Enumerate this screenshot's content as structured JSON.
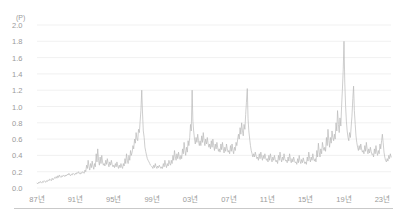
{
  "chart_data": {
    "type": "line",
    "title": "",
    "subtitle": "",
    "unit_label": "(P)",
    "xlabel": "",
    "ylabel": "",
    "ylim": [
      0.0,
      2.0
    ],
    "ytick_labels": [
      "2.0",
      "1.8",
      "1.6",
      "1.4",
      "1.2",
      "1.0",
      "0.8",
      "0.6",
      "0.4",
      "0.2",
      "0.0"
    ],
    "ytick_values": [
      2.0,
      1.8,
      1.6,
      1.4,
      1.2,
      1.0,
      0.8,
      0.6,
      0.4,
      0.2,
      0.0
    ],
    "xtick_labels": [
      "87년",
      "91년",
      "95년",
      "99년",
      "03년",
      "07년",
      "11년",
      "15년",
      "19년",
      "23년"
    ],
    "xtick_values": [
      1987,
      1991,
      1995,
      1999,
      2003,
      2007,
      2011,
      2015,
      2019,
      2023
    ],
    "xlim": [
      1987,
      2023.9
    ],
    "grid": true,
    "grid_axis": "y",
    "legend": false,
    "legend_position": "none",
    "line_color": "#b9b9b9",
    "grid_color": "#ebebeb",
    "text_color": "#9a9a9a",
    "series": [
      {
        "name": "series-1",
        "x": [
          1987.0,
          1987.08,
          1987.17,
          1987.25,
          1987.33,
          1987.42,
          1987.5,
          1987.58,
          1987.67,
          1987.75,
          1987.83,
          1987.92,
          1988.0,
          1988.08,
          1988.17,
          1988.25,
          1988.33,
          1988.42,
          1988.5,
          1988.58,
          1988.67,
          1988.75,
          1988.83,
          1988.92,
          1989.0,
          1989.08,
          1989.17,
          1989.25,
          1989.33,
          1989.42,
          1989.5,
          1989.58,
          1989.67,
          1989.75,
          1989.83,
          1989.92,
          1990.0,
          1990.08,
          1990.17,
          1990.25,
          1990.33,
          1990.42,
          1990.5,
          1990.58,
          1990.67,
          1990.75,
          1990.83,
          1990.92,
          1991.0,
          1991.08,
          1991.17,
          1991.25,
          1991.33,
          1991.42,
          1991.5,
          1991.58,
          1991.67,
          1991.75,
          1991.83,
          1991.92,
          1992.0,
          1992.08,
          1992.17,
          1992.25,
          1992.33,
          1992.42,
          1992.5,
          1992.58,
          1992.67,
          1992.75,
          1992.83,
          1992.92,
          1993.0,
          1993.08,
          1993.17,
          1993.25,
          1993.33,
          1993.42,
          1993.5,
          1993.58,
          1993.67,
          1993.75,
          1993.83,
          1993.92,
          1994.0,
          1994.08,
          1994.17,
          1994.25,
          1994.33,
          1994.42,
          1994.5,
          1994.58,
          1994.67,
          1994.75,
          1994.83,
          1994.92,
          1995.0,
          1995.08,
          1995.17,
          1995.25,
          1995.33,
          1995.42,
          1995.5,
          1995.58,
          1995.67,
          1995.75,
          1995.83,
          1995.92,
          1996.0,
          1996.08,
          1996.17,
          1996.25,
          1996.33,
          1996.42,
          1996.5,
          1996.58,
          1996.67,
          1996.75,
          1996.83,
          1996.92,
          1997.0,
          1997.08,
          1997.17,
          1997.25,
          1997.33,
          1997.42,
          1997.5,
          1997.58,
          1997.67,
          1997.75,
          1997.83,
          1997.92,
          1998.0,
          1998.08,
          1998.17,
          1998.25,
          1998.33,
          1998.42,
          1998.5,
          1998.58,
          1998.67,
          1998.75,
          1998.83,
          1998.92,
          1999.0,
          1999.08,
          1999.17,
          1999.25,
          1999.33,
          1999.42,
          1999.5,
          1999.58,
          1999.67,
          1999.75,
          1999.83,
          1999.92,
          2000.0,
          2000.08,
          2000.17,
          2000.25,
          2000.33,
          2000.42,
          2000.5,
          2000.58,
          2000.67,
          2000.75,
          2000.83,
          2000.92,
          2001.0,
          2001.08,
          2001.17,
          2001.25,
          2001.33,
          2001.42,
          2001.5,
          2001.58,
          2001.67,
          2001.75,
          2001.83,
          2001.92,
          2002.0,
          2002.08,
          2002.17,
          2002.25,
          2002.33,
          2002.42,
          2002.5,
          2002.58,
          2002.67,
          2002.75,
          2002.83,
          2002.92,
          2003.0,
          2003.08,
          2003.17,
          2003.25,
          2003.33,
          2003.42,
          2003.5,
          2003.58,
          2003.67,
          2003.75,
          2003.83,
          2003.92,
          2004.0,
          2004.08,
          2004.17,
          2004.25,
          2004.33,
          2004.42,
          2004.5,
          2004.58,
          2004.67,
          2004.75,
          2004.83,
          2004.92,
          2005.0,
          2005.08,
          2005.17,
          2005.25,
          2005.33,
          2005.42,
          2005.5,
          2005.58,
          2005.67,
          2005.75,
          2005.83,
          2005.92,
          2006.0,
          2006.08,
          2006.17,
          2006.25,
          2006.33,
          2006.42,
          2006.5,
          2006.58,
          2006.67,
          2006.75,
          2006.83,
          2006.92,
          2007.0,
          2007.08,
          2007.17,
          2007.25,
          2007.33,
          2007.42,
          2007.5,
          2007.58,
          2007.67,
          2007.75,
          2007.83,
          2007.92,
          2008.0,
          2008.08,
          2008.17,
          2008.25,
          2008.33,
          2008.42,
          2008.5,
          2008.58,
          2008.67,
          2008.75,
          2008.83,
          2008.92,
          2009.0,
          2009.08,
          2009.17,
          2009.25,
          2009.33,
          2009.42,
          2009.5,
          2009.58,
          2009.67,
          2009.75,
          2009.83,
          2009.92,
          2010.0,
          2010.08,
          2010.17,
          2010.25,
          2010.33,
          2010.42,
          2010.5,
          2010.58,
          2010.67,
          2010.75,
          2010.83,
          2010.92,
          2011.0,
          2011.08,
          2011.17,
          2011.25,
          2011.33,
          2011.42,
          2011.5,
          2011.58,
          2011.67,
          2011.75,
          2011.83,
          2011.92,
          2012.0,
          2012.08,
          2012.17,
          2012.25,
          2012.33,
          2012.42,
          2012.5,
          2012.58,
          2012.67,
          2012.75,
          2012.83,
          2012.92,
          2013.0,
          2013.08,
          2013.17,
          2013.25,
          2013.33,
          2013.42,
          2013.5,
          2013.58,
          2013.67,
          2013.75,
          2013.83,
          2013.92,
          2014.0,
          2014.08,
          2014.17,
          2014.25,
          2014.33,
          2014.42,
          2014.5,
          2014.58,
          2014.67,
          2014.75,
          2014.83,
          2014.92,
          2015.0,
          2015.08,
          2015.17,
          2015.25,
          2015.33,
          2015.42,
          2015.5,
          2015.58,
          2015.67,
          2015.75,
          2015.83,
          2015.92,
          2016.0,
          2016.08,
          2016.17,
          2016.25,
          2016.33,
          2016.42,
          2016.5,
          2016.58,
          2016.67,
          2016.75,
          2016.83,
          2016.92,
          2017.0,
          2017.08,
          2017.17,
          2017.25,
          2017.33,
          2017.42,
          2017.5,
          2017.58,
          2017.67,
          2017.75,
          2017.83,
          2017.92,
          2018.0,
          2018.08,
          2018.17,
          2018.25,
          2018.33,
          2018.42,
          2018.5,
          2018.58,
          2018.67,
          2018.75,
          2018.83,
          2018.92,
          2019.0,
          2019.08,
          2019.17,
          2019.25,
          2019.33,
          2019.42,
          2019.5,
          2019.58,
          2019.67,
          2019.75,
          2019.83,
          2019.92,
          2020.0,
          2020.08,
          2020.17,
          2020.25,
          2020.33,
          2020.42,
          2020.5,
          2020.58,
          2020.67,
          2020.75,
          2020.83,
          2020.92,
          2021.0,
          2021.08,
          2021.17,
          2021.25,
          2021.33,
          2021.42,
          2021.5,
          2021.58,
          2021.67,
          2021.75,
          2021.83,
          2021.92,
          2022.0,
          2022.08,
          2022.17,
          2022.25,
          2022.33,
          2022.42,
          2022.5,
          2022.58,
          2022.67,
          2022.75,
          2022.83,
          2022.92,
          2023.0,
          2023.08,
          2023.17,
          2023.25,
          2023.33,
          2023.42,
          2023.5,
          2023.58,
          2023.67,
          2023.75,
          2023.83,
          2023.92
        ],
        "values": [
          0.06,
          0.05,
          0.07,
          0.06,
          0.08,
          0.07,
          0.06,
          0.08,
          0.07,
          0.09,
          0.08,
          0.07,
          0.09,
          0.08,
          0.1,
          0.09,
          0.11,
          0.1,
          0.09,
          0.12,
          0.1,
          0.11,
          0.13,
          0.12,
          0.14,
          0.12,
          0.15,
          0.13,
          0.16,
          0.14,
          0.13,
          0.15,
          0.14,
          0.16,
          0.15,
          0.14,
          0.16,
          0.15,
          0.17,
          0.16,
          0.18,
          0.16,
          0.15,
          0.17,
          0.16,
          0.18,
          0.17,
          0.16,
          0.18,
          0.17,
          0.19,
          0.18,
          0.2,
          0.18,
          0.17,
          0.19,
          0.18,
          0.2,
          0.19,
          0.18,
          0.22,
          0.2,
          0.28,
          0.24,
          0.34,
          0.26,
          0.22,
          0.3,
          0.25,
          0.33,
          0.27,
          0.23,
          0.3,
          0.26,
          0.42,
          0.32,
          0.48,
          0.34,
          0.28,
          0.38,
          0.3,
          0.4,
          0.32,
          0.28,
          0.3,
          0.27,
          0.34,
          0.29,
          0.36,
          0.3,
          0.26,
          0.32,
          0.28,
          0.34,
          0.29,
          0.26,
          0.28,
          0.25,
          0.3,
          0.26,
          0.32,
          0.27,
          0.24,
          0.28,
          0.25,
          0.3,
          0.26,
          0.24,
          0.3,
          0.27,
          0.36,
          0.3,
          0.42,
          0.34,
          0.3,
          0.4,
          0.34,
          0.46,
          0.4,
          0.44,
          0.52,
          0.48,
          0.6,
          0.55,
          0.68,
          0.6,
          0.58,
          0.72,
          0.68,
          0.82,
          0.95,
          1.2,
          0.92,
          0.7,
          0.62,
          0.5,
          0.45,
          0.4,
          0.36,
          0.34,
          0.32,
          0.3,
          0.28,
          0.27,
          0.26,
          0.24,
          0.28,
          0.25,
          0.3,
          0.26,
          0.24,
          0.27,
          0.25,
          0.28,
          0.26,
          0.24,
          0.26,
          0.24,
          0.3,
          0.26,
          0.34,
          0.28,
          0.25,
          0.3,
          0.27,
          0.34,
          0.3,
          0.28,
          0.34,
          0.3,
          0.4,
          0.34,
          0.46,
          0.38,
          0.34,
          0.42,
          0.36,
          0.44,
          0.38,
          0.35,
          0.4,
          0.36,
          0.48,
          0.42,
          0.56,
          0.46,
          0.4,
          0.5,
          0.44,
          0.58,
          0.52,
          0.62,
          0.78,
          0.7,
          1.2,
          0.82,
          0.7,
          0.6,
          0.54,
          0.62,
          0.56,
          0.66,
          0.58,
          0.52,
          0.58,
          0.52,
          0.64,
          0.56,
          0.68,
          0.58,
          0.52,
          0.6,
          0.54,
          0.62,
          0.55,
          0.5,
          0.54,
          0.48,
          0.58,
          0.5,
          0.6,
          0.52,
          0.46,
          0.54,
          0.48,
          0.56,
          0.5,
          0.45,
          0.48,
          0.44,
          0.54,
          0.47,
          0.56,
          0.48,
          0.43,
          0.5,
          0.45,
          0.54,
          0.48,
          0.44,
          0.46,
          0.42,
          0.52,
          0.45,
          0.54,
          0.46,
          0.42,
          0.5,
          0.46,
          0.56,
          0.52,
          0.6,
          0.66,
          0.6,
          0.74,
          0.66,
          0.8,
          0.7,
          0.64,
          0.78,
          0.72,
          0.9,
          1.05,
          1.22,
          0.85,
          0.7,
          0.6,
          0.52,
          0.46,
          0.42,
          0.38,
          0.42,
          0.38,
          0.44,
          0.4,
          0.36,
          0.38,
          0.34,
          0.42,
          0.36,
          0.44,
          0.38,
          0.34,
          0.4,
          0.36,
          0.42,
          0.37,
          0.34,
          0.36,
          0.32,
          0.4,
          0.34,
          0.42,
          0.36,
          0.32,
          0.38,
          0.34,
          0.4,
          0.35,
          0.32,
          0.34,
          0.3,
          0.4,
          0.34,
          0.44,
          0.36,
          0.32,
          0.38,
          0.34,
          0.42,
          0.36,
          0.33,
          0.34,
          0.31,
          0.38,
          0.33,
          0.42,
          0.35,
          0.31,
          0.36,
          0.32,
          0.38,
          0.34,
          0.31,
          0.32,
          0.29,
          0.36,
          0.31,
          0.4,
          0.33,
          0.3,
          0.35,
          0.31,
          0.37,
          0.33,
          0.3,
          0.32,
          0.29,
          0.38,
          0.33,
          0.44,
          0.36,
          0.32,
          0.38,
          0.34,
          0.42,
          0.36,
          0.33,
          0.36,
          0.32,
          0.46,
          0.38,
          0.55,
          0.44,
          0.38,
          0.48,
          0.42,
          0.56,
          0.5,
          0.46,
          0.5,
          0.45,
          0.62,
          0.52,
          0.72,
          0.58,
          0.5,
          0.62,
          0.55,
          0.7,
          0.62,
          0.58,
          0.66,
          0.6,
          0.8,
          0.7,
          0.95,
          0.78,
          0.68,
          0.86,
          0.76,
          1.0,
          1.2,
          1.45,
          1.8,
          1.3,
          1.0,
          0.82,
          0.7,
          0.62,
          0.58,
          0.68,
          0.62,
          0.76,
          0.88,
          1.1,
          1.25,
          0.95,
          0.78,
          0.64,
          0.56,
          0.5,
          0.46,
          0.52,
          0.47,
          0.54,
          0.48,
          0.44,
          0.46,
          0.42,
          0.52,
          0.45,
          0.56,
          0.47,
          0.42,
          0.48,
          0.43,
          0.5,
          0.45,
          0.41,
          0.42,
          0.38,
          0.48,
          0.42,
          0.52,
          0.44,
          0.4,
          0.46,
          0.42,
          0.54,
          0.48,
          0.58,
          0.66,
          0.56,
          0.44,
          0.38,
          0.34,
          0.32,
          0.36,
          0.33,
          0.4,
          0.36,
          0.42,
          0.38
        ]
      }
    ]
  }
}
